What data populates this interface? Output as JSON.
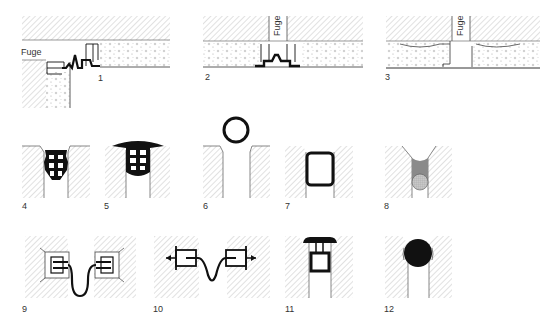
{
  "figure": {
    "joint_label": "Fuge",
    "panels": [
      {
        "id": "1",
        "label": "1",
        "x": 98,
        "y": 77
      },
      {
        "id": "2",
        "label": "2",
        "x": 205,
        "y": 75
      },
      {
        "id": "3",
        "label": "3",
        "x": 385,
        "y": 75
      },
      {
        "id": "4",
        "label": "4",
        "x": 22,
        "y": 204
      },
      {
        "id": "5",
        "label": "5",
        "x": 104,
        "y": 204
      },
      {
        "id": "6",
        "label": "6",
        "x": 203,
        "y": 204
      },
      {
        "id": "7",
        "label": "7",
        "x": 285,
        "y": 204
      },
      {
        "id": "8",
        "label": "8",
        "x": 384,
        "y": 204
      },
      {
        "id": "9",
        "label": "9",
        "x": 22,
        "y": 305
      },
      {
        "id": "10",
        "label": "10",
        "x": 153,
        "y": 305
      },
      {
        "id": "11",
        "label": "11",
        "x": 285,
        "y": 305
      },
      {
        "id": "12",
        "label": "12",
        "x": 384,
        "y": 305
      }
    ]
  },
  "colors": {
    "line": "#111111",
    "hatch": "#9a9a9a",
    "fill_gray": "#8a8a8a",
    "background": "#ffffff"
  }
}
